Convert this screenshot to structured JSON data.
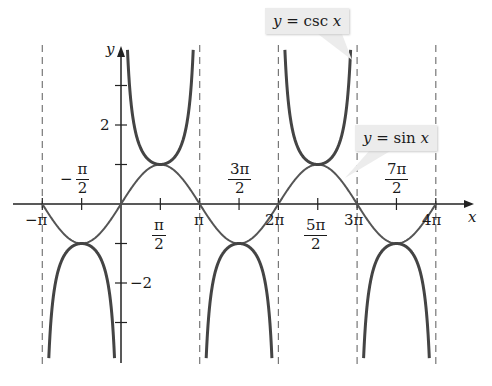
{
  "chart_data": {
    "type": "line",
    "title": "",
    "xlabel": "x",
    "ylabel": "y",
    "xlim": [
      -3.6,
      14.0
    ],
    "ylim": [
      -4.0,
      4.2
    ],
    "grid": false,
    "x_tick_labels": [
      "−π",
      "−π/2",
      "π/2",
      "π",
      "3π/2",
      "2π",
      "5π/2",
      "3π",
      "7π/2",
      "4π"
    ],
    "x_tick_values": [
      -3.1416,
      -1.5708,
      1.5708,
      3.1416,
      4.7124,
      6.2832,
      7.854,
      9.4248,
      10.9956,
      12.5664
    ],
    "y_tick_labels": [
      "2",
      "−2"
    ],
    "y_tick_values": [
      2,
      -2
    ],
    "y_minor_ticks": [
      -3,
      -1,
      1,
      3
    ],
    "asymptotes": [
      "−π",
      "0",
      "π",
      "2π",
      "3π",
      "4π"
    ],
    "series": [
      {
        "name": "y = sin x",
        "function": "sin(x)",
        "domain": [
          -3.1416,
          12.5664
        ],
        "style": "thin"
      },
      {
        "name": "y = csc x",
        "function": "1/sin(x)",
        "domain": [
          -3.1416,
          12.5664
        ],
        "style": "thick"
      }
    ],
    "annotations": [
      {
        "text": "y = csc x",
        "points_to": "csc branch near x = 3π"
      },
      {
        "text": "y = sin x",
        "points_to": "sin curve near x = 11π/4"
      }
    ]
  },
  "labels": {
    "x_axis": "x",
    "y_axis": "y",
    "y_pos2": "2",
    "y_neg2": "−2",
    "neg_pi": "−π",
    "pi": "π",
    "two_pi": "2π",
    "three_pi": "3π",
    "four_pi": "4π",
    "neg_pi_half": {
      "sign": "−",
      "num": "π",
      "den": "2"
    },
    "pi_half": {
      "num": "π",
      "den": "2"
    },
    "three_pi_half": {
      "num": "3π",
      "den": "2"
    },
    "five_pi_half": {
      "num": "5π",
      "den": "2"
    },
    "seven_pi_half": {
      "num": "7π",
      "den": "2"
    },
    "csc_label": {
      "lhs": "y",
      "rhs": " = csc ",
      "var": "x"
    },
    "sin_label": {
      "lhs": "y",
      "rhs": " = sin ",
      "var": "x"
    }
  }
}
